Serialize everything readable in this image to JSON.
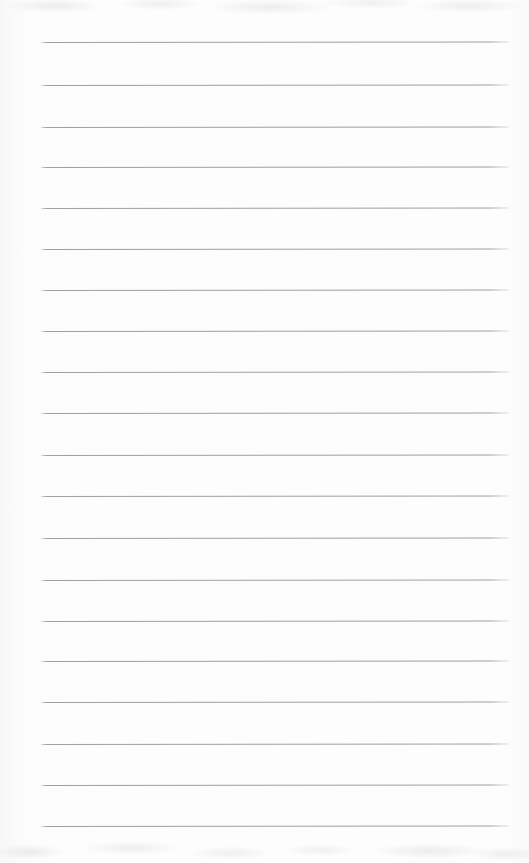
{
  "document": {
    "kind": "scanned-ruled-notepad-page",
    "title": "",
    "body_text": "",
    "handwriting": "",
    "printed_text": "",
    "page_number": "",
    "header": "",
    "footer": ""
  },
  "page": {
    "width": 529,
    "height": 863,
    "background_color": "#fdfdfd",
    "paper_tint_color": "#fdfdfd",
    "scan_shadow_color": "#a8aaae"
  },
  "ruling": {
    "line_color": "#969ba0",
    "line_color_faded": "#b8bcc0",
    "line_thickness_px": 1,
    "line_count": 20,
    "line_spacing_px": 41.3,
    "left_margin_px": 41,
    "right_edge_px": 509,
    "first_line_y_px": 42,
    "last_line_y_px": 826,
    "lines": [
      {
        "index": 1,
        "y": 42,
        "x_start": 41,
        "x_end": 509
      },
      {
        "index": 2,
        "y": 85,
        "x_start": 41,
        "x_end": 509
      },
      {
        "index": 3,
        "y": 127,
        "x_start": 41,
        "x_end": 509
      },
      {
        "index": 4,
        "y": 167,
        "x_start": 41,
        "x_end": 509
      },
      {
        "index": 5,
        "y": 208,
        "x_start": 41,
        "x_end": 509
      },
      {
        "index": 6,
        "y": 249,
        "x_start": 41,
        "x_end": 509
      },
      {
        "index": 7,
        "y": 290,
        "x_start": 41,
        "x_end": 509
      },
      {
        "index": 8,
        "y": 331,
        "x_start": 41,
        "x_end": 509
      },
      {
        "index": 9,
        "y": 372,
        "x_start": 41,
        "x_end": 509
      },
      {
        "index": 10,
        "y": 413,
        "x_start": 41,
        "x_end": 509
      },
      {
        "index": 11,
        "y": 455,
        "x_start": 41,
        "x_end": 509
      },
      {
        "index": 12,
        "y": 496,
        "x_start": 41,
        "x_end": 509
      },
      {
        "index": 13,
        "y": 538,
        "x_start": 41,
        "x_end": 509
      },
      {
        "index": 14,
        "y": 580,
        "x_start": 41,
        "x_end": 509
      },
      {
        "index": 15,
        "y": 621,
        "x_start": 41,
        "x_end": 509
      },
      {
        "index": 16,
        "y": 661,
        "x_start": 41,
        "x_end": 509
      },
      {
        "index": 17,
        "y": 702,
        "x_start": 41,
        "x_end": 509
      },
      {
        "index": 18,
        "y": 744,
        "x_start": 41,
        "x_end": 509
      },
      {
        "index": 19,
        "y": 785,
        "x_start": 41,
        "x_end": 509
      },
      {
        "index": 20,
        "y": 826,
        "x_start": 41,
        "x_end": 509
      }
    ]
  }
}
